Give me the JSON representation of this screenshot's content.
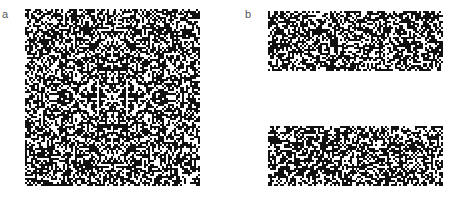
{
  "figure": {
    "panels": [
      {
        "label": "a",
        "description": "square random-dot pattern with symmetric structure",
        "shape": "square"
      },
      {
        "label": "b",
        "description": "two rectangular random-dot patterns",
        "shape": "two-rectangles"
      }
    ]
  },
  "colors": {
    "dot": "#111111",
    "background": "#ffffff",
    "label": "#555555"
  }
}
